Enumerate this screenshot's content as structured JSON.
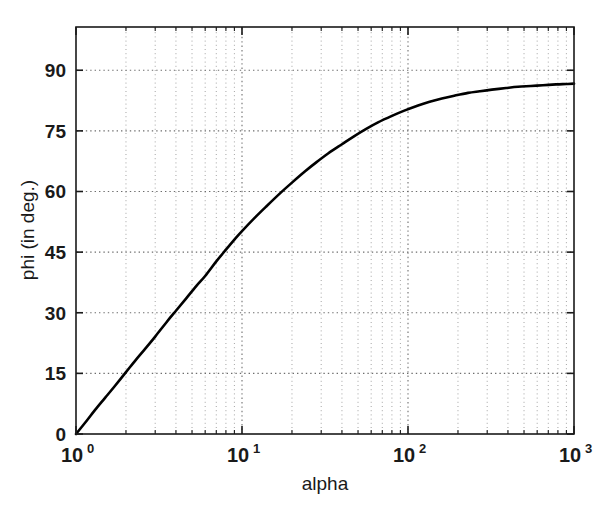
{
  "chart_data": {
    "type": "line",
    "title": "",
    "xlabel": "alpha",
    "ylabel": "phi (in deg.)",
    "xscale": "log",
    "yscale": "linear",
    "xlim": [
      1,
      1000
    ],
    "ylim": [
      0,
      100.7
    ],
    "grid": true,
    "grid_style": "dotted",
    "legend": "none",
    "x_tick_labels": [
      "10^0",
      "10^1",
      "10^2",
      "10^3"
    ],
    "x_tick_values": [
      1,
      10,
      100,
      1000
    ],
    "x_tick_bases": [
      "10",
      "10",
      "10",
      "10"
    ],
    "x_tick_exponents": [
      "0",
      "1",
      "2",
      "3"
    ],
    "y_tick_labels": [
      "0",
      "15",
      "30",
      "45",
      "60",
      "75",
      "90"
    ],
    "y_tick_values": [
      0,
      15,
      30,
      45,
      60,
      75,
      90
    ],
    "series": [
      {
        "name": "phi",
        "color": "#000000",
        "linewidth": 2.6,
        "x": [
          1,
          1.15,
          1.3,
          1.5,
          1.7,
          2,
          2.3,
          2.6,
          3,
          3.5,
          4,
          4.6,
          5.3,
          6,
          7,
          8,
          9,
          10,
          12,
          14,
          17,
          20,
          24,
          28,
          33,
          40,
          47,
          56,
          66,
          80,
          95,
          115,
          135,
          160,
          190,
          230,
          270,
          320,
          390,
          460,
          550,
          650,
          780,
          900,
          1000
        ],
        "y": [
          0,
          3.1,
          5.9,
          9.0,
          11.7,
          15.3,
          18.4,
          21.0,
          24.1,
          27.6,
          30.5,
          33.5,
          36.6,
          39.1,
          42.7,
          45.6,
          48.1,
          50.2,
          53.6,
          56.3,
          59.6,
          62.2,
          65.0,
          67.2,
          69.4,
          71.7,
          73.6,
          75.5,
          77.1,
          78.7,
          80.0,
          81.3,
          82.2,
          83.0,
          83.7,
          84.4,
          84.8,
          85.2,
          85.6,
          85.9,
          86.1,
          86.3,
          86.5,
          86.6,
          86.7
        ]
      }
    ],
    "annotations": []
  },
  "axes": {
    "x_title": "alpha",
    "y_title": "phi (in deg.)"
  }
}
